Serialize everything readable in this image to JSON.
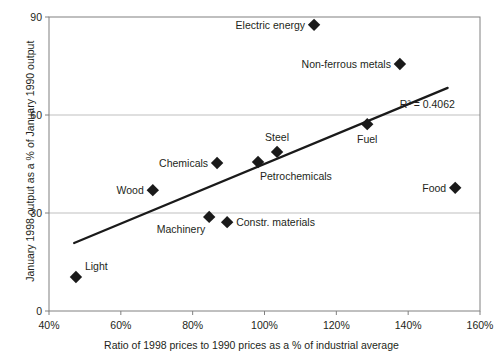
{
  "chart_data": {
    "type": "scatter",
    "title": "",
    "xlabel": "Ratio of 1998 prices to 1990 prices  as a % of industrial average",
    "ylabel": "January 1998 output as a % of January 1990 output",
    "xlim": [
      40,
      160
    ],
    "ylim": [
      0,
      90
    ],
    "xticks": [
      "40%",
      "60%",
      "80%",
      "100%",
      "120%",
      "140%",
      "160%"
    ],
    "xtick_values": [
      40,
      60,
      80,
      100,
      120,
      140,
      160
    ],
    "yticks": [
      "0",
      "30",
      "60",
      "90"
    ],
    "ytick_values": [
      0,
      30,
      60,
      90
    ],
    "grid": "horizontal",
    "legend": "none",
    "marker": "diamond",
    "marker_color": "#1a1a1a",
    "trendline": {
      "type": "linear",
      "x_start": 47,
      "y_start": 20.8,
      "x_end": 151,
      "y_end": 68.3,
      "color": "#1a1a1a",
      "annotation": "R² = 0.4062",
      "annotation_x": 153,
      "annotation_y": 63.5
    },
    "points": [
      {
        "name": "Electric energy",
        "x": 113.8,
        "y": 87.6,
        "label_side": "left"
      },
      {
        "name": "Non-ferrous metals",
        "x": 137.7,
        "y": 75.6,
        "label_side": "left"
      },
      {
        "name": "Fuel",
        "x": 128.6,
        "y": 57.2,
        "label_side": "below"
      },
      {
        "name": "Steel",
        "x": 103.5,
        "y": 48.7,
        "label_side": "above"
      },
      {
        "name": "Petrochemicals",
        "x": 98.2,
        "y": 45.6,
        "label_side": "belowright"
      },
      {
        "name": "Chemicals",
        "x": 86.8,
        "y": 45.3,
        "label_side": "left"
      },
      {
        "name": "Food",
        "x": 153.1,
        "y": 37.7,
        "label_side": "left"
      },
      {
        "name": "Wood",
        "x": 68.9,
        "y": 37.0,
        "label_side": "left"
      },
      {
        "name": "Machinery",
        "x": 84.6,
        "y": 28.8,
        "label_side": "belowleft"
      },
      {
        "name": "Constr. materials",
        "x": 89.6,
        "y": 27.2,
        "label_side": "right"
      },
      {
        "name": "Light",
        "x": 47.5,
        "y": 10.4,
        "label_side": "aboveright"
      }
    ]
  },
  "style": {
    "axis_color": "#808080",
    "grid_color": "#bfbfbf",
    "plot_border_color": "#808080",
    "text_color": "#231f20",
    "background": "#ffffff"
  }
}
